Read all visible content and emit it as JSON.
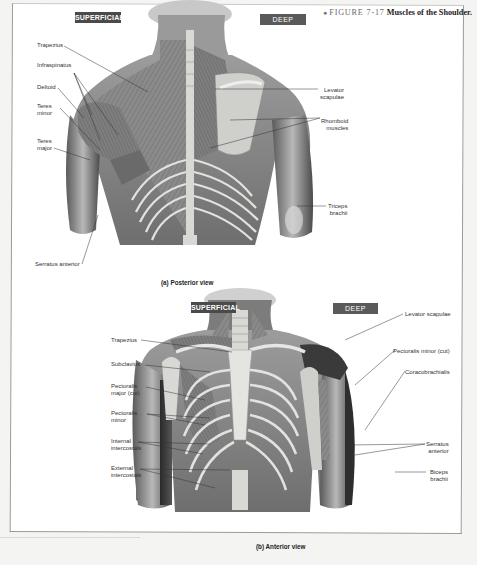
{
  "figure": {
    "bullet": "●",
    "number": "FIGURE 7-17",
    "title": "Muscles of the Shoulder."
  },
  "posterior": {
    "badge_superficial": "SUPERFICIAL",
    "badge_deep": "DEEP",
    "caption": "(a) Posterior view",
    "left_labels": [
      {
        "text": "Trapezius"
      },
      {
        "text": "Infraspinatus"
      },
      {
        "text": "Deltoid"
      },
      {
        "text": "Teres\nminor"
      },
      {
        "text": "Teres\nmajor"
      },
      {
        "text": "Serratus anterior"
      }
    ],
    "right_labels": [
      {
        "text": "Levator\nscapulae"
      },
      {
        "text": "Rhomboid\nmuscles"
      },
      {
        "text": "Triceps\nbrachii"
      }
    ]
  },
  "anterior": {
    "badge_superficial": "SUPERFICIAL",
    "badge_deep": "DEEP",
    "caption": "(b) Anterior view",
    "left_labels": [
      {
        "text": "Trapezius"
      },
      {
        "text": "Subclavius"
      },
      {
        "text": "Pectoralis\nmajor (cut)"
      },
      {
        "text": "Pectoralis\nminor"
      },
      {
        "text": "Internal\nintercostals"
      },
      {
        "text": "External\nintercostals"
      }
    ],
    "right_labels": [
      {
        "text": "Levator scapulae"
      },
      {
        "text": "Pectoralis minor (cut)"
      },
      {
        "text": "Coracobrachialis"
      },
      {
        "text": "Serratus\nanterior"
      },
      {
        "text": "Biceps\nbrachii"
      }
    ]
  },
  "colors": {
    "badge_superficial": "#4a4a4a",
    "badge_deep": "#5a5a5a",
    "muscle_mid": "#8c8c8c",
    "muscle_dark": "#3c3c3c",
    "bone": "#dcdcd8"
  }
}
